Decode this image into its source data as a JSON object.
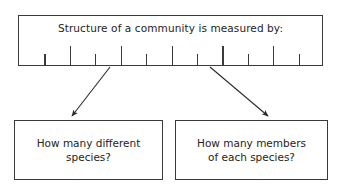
{
  "diagram": {
    "title": "Structure of a community is measured by:",
    "root_box": {
      "label": "Structure of a community is measured by:",
      "ticks": {
        "count": 11,
        "pattern": [
          "short",
          "tall",
          "short",
          "tall",
          "short",
          "tall",
          "short",
          "tall",
          "short",
          "tall",
          "short"
        ]
      }
    },
    "branches": [
      {
        "id": "branch-left",
        "label": "How many different species?",
        "line1": "How many different",
        "line2": "species?",
        "arrow": {
          "from_x": 110,
          "from_y": 67,
          "to_x": 72,
          "to_y": 116
        }
      },
      {
        "id": "branch-right",
        "label": "How many members of each species?",
        "line1": "How many members",
        "line2": "of each species?",
        "arrow": {
          "from_x": 210,
          "from_y": 67,
          "to_x": 268,
          "to_y": 116
        }
      }
    ],
    "colors": {
      "stroke": "#3a3a3a",
      "text": "#242424",
      "background": "#ffffff"
    }
  }
}
